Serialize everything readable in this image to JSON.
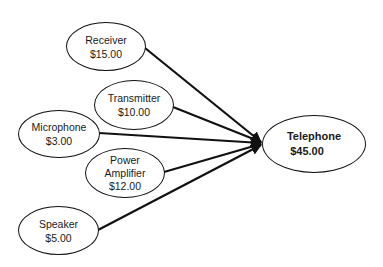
{
  "diagram": {
    "type": "cost-rollup",
    "target": {
      "id": "telephone",
      "label": "Telephone",
      "cost": "$45.00"
    },
    "components": [
      {
        "id": "receiver",
        "label": "Receiver",
        "cost": "$15.00"
      },
      {
        "id": "transmitter",
        "label": "Transmitter",
        "cost": "$10.00"
      },
      {
        "id": "microphone",
        "label": "Microphone",
        "cost": "$3.00"
      },
      {
        "id": "power-amplifier",
        "label_line1": "Power",
        "label_line2": "Amplifier",
        "label": "Power Amplifier",
        "cost": "$12.00"
      },
      {
        "id": "speaker",
        "label": "Speaker",
        "cost": "$5.00"
      }
    ],
    "edges": [
      {
        "from": "receiver",
        "to": "telephone"
      },
      {
        "from": "transmitter",
        "to": "telephone"
      },
      {
        "from": "microphone",
        "to": "telephone"
      },
      {
        "from": "power-amplifier",
        "to": "telephone"
      },
      {
        "from": "speaker",
        "to": "telephone"
      }
    ],
    "colors": {
      "stroke": "#111111",
      "text": "#1a1a1a",
      "background": "#ffffff"
    }
  }
}
